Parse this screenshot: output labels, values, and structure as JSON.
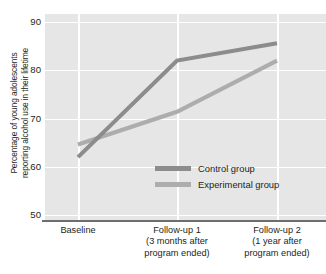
{
  "chart_data": {
    "type": "line",
    "title": "",
    "xlabel": "",
    "ylabel_line1": "Percentage of young adolescents",
    "ylabel_line2": "reporting alcohol use in their lifetime",
    "categories": [
      {
        "line1": "Baseline",
        "line2": "",
        "line3": ""
      },
      {
        "line1": "Follow-up 1",
        "line2": "(3 months after",
        "line3": "program ended)"
      },
      {
        "line1": "Follow-up 2",
        "line2": "(1 year after",
        "line3": "program ended)"
      }
    ],
    "ylim": [
      50,
      90
    ],
    "yticks": [
      "50",
      "60",
      "70",
      "80",
      "90"
    ],
    "grid": "horizontal-and-vertical-white",
    "legend_position": "inside-bottom-center",
    "series": [
      {
        "name": "Control group",
        "color": "#8c8c8c",
        "values": [
          62.0,
          82.0,
          85.6
        ]
      },
      {
        "name": "Experimental group",
        "color": "#adadad",
        "values": [
          64.6,
          71.4,
          82.0
        ]
      }
    ]
  },
  "colors": {
    "plot_background": "#e6e6e6",
    "gridline": "#ffffff",
    "axis_rule": "#6d6e71",
    "text": "#231f20",
    "control_series": "#8c8c8c",
    "experimental_series": "#adadad"
  }
}
